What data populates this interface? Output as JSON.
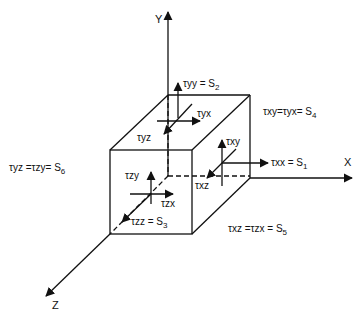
{
  "axes": {
    "x": "X",
    "y": "Y",
    "z": "Z"
  },
  "stress_labels": {
    "tyy": {
      "text": "τyy = S",
      "sub": "2"
    },
    "tyx": {
      "text": "τyx"
    },
    "tyz": {
      "text": "τyz"
    },
    "txy_eq": {
      "text": "τxy=τyx= S",
      "sub": "4"
    },
    "txy": {
      "text": "τxy"
    },
    "txx": {
      "text": "τxx = S",
      "sub": "1"
    },
    "txz": {
      "text": "τxz"
    },
    "tyz_eq": {
      "text": "τyz =τzy= S",
      "sub": "6"
    },
    "tzy": {
      "text": "τzy"
    },
    "tzx": {
      "text": "τzx"
    },
    "tzz": {
      "text": "τzz = S",
      "sub": "3"
    },
    "txz_eq": {
      "text": "τxz =τzx = S",
      "sub": "5"
    }
  },
  "colors": {
    "ink": "#111111",
    "background": "#ffffff"
  }
}
